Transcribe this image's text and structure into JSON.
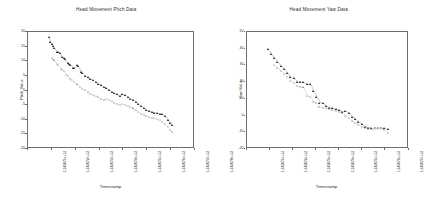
{
  "figure": {
    "background": "#ffffff",
    "marker_filled_color": "#111111",
    "marker_open_color": "#8a8a8a"
  },
  "panels": [
    {
      "id": "pitch-panel",
      "title": "Head Movement Pitch Data",
      "xlabel": "Timestamp",
      "ylabel": "Pitch Value",
      "yticks": [
        "20",
        "15",
        "10",
        "5",
        "0",
        "-5",
        "-10",
        "-15",
        "-20"
      ],
      "xticks": [
        "1.342071e+12",
        "1.342072e+12",
        "1.342073e+12",
        "1.342074e+12",
        "1.342075e+12",
        "1.342076e+12",
        "1.342077e+12",
        "1.342078e+12"
      ]
    },
    {
      "id": "yaw-panel",
      "title": "Head Movement Yaw Data",
      "xlabel": "Timestamp",
      "ylabel": "Yaw Value",
      "yticks": [
        "50",
        "40",
        "30",
        "20",
        "10",
        "0",
        "-10",
        "-20"
      ],
      "xticks": [
        "1.342071e+12",
        "1.342072e+12",
        "1.342073e+12",
        "1.342074e+12",
        "1.342075e+12",
        "1.342076e+12",
        "1.342077e+12",
        "1.342078e+12"
      ]
    }
  ],
  "chart_data": [
    {
      "type": "scatter",
      "title": "Head Movement Pitch Data",
      "xlabel": "Timestamp",
      "ylabel": "Pitch Value",
      "grid": false,
      "legend": "none",
      "xlim": [
        0,
        100
      ],
      "ylim": [
        -20,
        20
      ],
      "xtick_values": [
        0,
        14.3,
        28.6,
        42.9,
        57.1,
        71.4,
        85.7,
        100
      ],
      "ytick_values": [
        20,
        15,
        10,
        5,
        0,
        -5,
        -10,
        -15,
        -20
      ],
      "series": [
        {
          "name": "pitch-filled",
          "marker": "filled-triangle",
          "x": [
            13.5,
            14.2,
            15.0,
            15.8,
            16.6,
            18.2,
            19.0,
            19.8,
            21.4,
            22.2,
            23.0,
            24.6,
            25.4,
            26.2,
            27.8,
            28.6,
            30.2,
            31.0,
            32.6,
            33.4,
            35.0,
            36.6,
            38.2,
            39.8,
            41.4,
            43.0,
            44.6,
            46.2,
            47.8,
            49.4,
            51.0,
            52.6,
            54.2,
            55.8,
            57.4,
            59.0,
            60.6,
            62.2,
            63.8,
            65.4,
            67.0,
            68.6,
            70.2,
            71.8,
            73.4,
            75.0,
            76.6,
            78.2,
            79.8,
            81.4,
            83.0,
            84.6,
            86.2,
            87.0
          ],
          "y": [
            17.8,
            16.0,
            15.4,
            14.6,
            14.2,
            12.8,
            12.6,
            12.4,
            11.0,
            10.6,
            10.2,
            9.0,
            8.6,
            8.4,
            7.4,
            7.2,
            8.2,
            7.8,
            6.0,
            5.6,
            4.6,
            4.0,
            3.6,
            3.0,
            2.4,
            1.8,
            1.4,
            0.8,
            0.4,
            -0.2,
            -1.0,
            -1.4,
            -1.8,
            -2.2,
            -1.6,
            -2.0,
            -2.6,
            -3.2,
            -3.6,
            -4.4,
            -5.0,
            -5.8,
            -6.4,
            -7.0,
            -7.4,
            -7.8,
            -8.0,
            -8.2,
            -8.4,
            -8.6,
            -9.2,
            -10.4,
            -11.6,
            -12.4
          ]
        },
        {
          "name": "pitch-open",
          "marker": "open-triangle",
          "x": [
            15.0,
            15.8,
            16.6,
            18.2,
            19.0,
            20.6,
            21.4,
            22.2,
            23.8,
            24.6,
            26.2,
            27.0,
            28.6,
            30.2,
            31.8,
            33.4,
            35.0,
            36.6,
            38.2,
            39.8,
            41.4,
            43.0,
            44.6,
            46.2,
            47.8,
            49.4,
            51.0,
            52.6,
            54.2,
            55.8,
            57.4,
            59.0,
            60.6,
            62.2,
            63.8,
            65.4,
            67.0,
            68.6,
            70.2,
            71.8,
            73.4,
            75.0,
            76.6,
            78.2,
            79.8,
            81.4,
            83.0,
            84.6,
            86.2,
            87.2
          ],
          "y": [
            10.6,
            10.2,
            9.8,
            8.6,
            8.2,
            7.0,
            6.6,
            6.2,
            5.0,
            4.6,
            3.6,
            3.2,
            2.4,
            1.6,
            0.8,
            0.2,
            -0.4,
            -1.0,
            -1.6,
            -2.0,
            -2.4,
            -2.8,
            -3.2,
            -3.6,
            -3.4,
            -3.8,
            -4.2,
            -4.6,
            -5.0,
            -5.4,
            -5.0,
            -5.4,
            -5.8,
            -6.2,
            -6.6,
            -7.2,
            -7.8,
            -8.4,
            -8.8,
            -9.2,
            -9.6,
            -9.8,
            -10.0,
            -10.2,
            -10.6,
            -11.2,
            -12.0,
            -13.0,
            -14.0,
            -14.6
          ]
        }
      ]
    },
    {
      "type": "scatter",
      "title": "Head Movement Yaw Data",
      "xlabel": "Timestamp",
      "ylabel": "Yaw Value",
      "grid": false,
      "legend": "none",
      "xlim": [
        0,
        100
      ],
      "ylim": [
        -20,
        50
      ],
      "xtick_values": [
        0,
        14.3,
        28.6,
        42.9,
        57.1,
        71.4,
        85.7,
        100
      ],
      "ytick_values": [
        50,
        40,
        30,
        20,
        10,
        0,
        -10,
        -20
      ],
      "series": [
        {
          "name": "yaw-filled",
          "marker": "filled-triangle",
          "x": [
            14.0,
            16.0,
            18.0,
            20.0,
            22.0,
            24.0,
            26.0,
            28.0,
            30.0,
            32.0,
            34.0,
            36.0,
            38.0,
            40.0,
            42.0,
            44.0,
            46.0,
            48.0,
            50.0,
            52.0,
            54.0,
            56.0,
            58.0,
            60.0,
            62.0,
            64.0,
            66.0,
            68.0,
            70.0,
            72.0,
            74.0,
            76.0,
            78.0,
            80.0,
            82.0,
            84.0,
            86.0,
            88.0
          ],
          "y": [
            39.0,
            36.0,
            33.5,
            31.0,
            29.0,
            27.0,
            24.5,
            22.0,
            21.5,
            19.5,
            19.5,
            19.0,
            18.0,
            18.0,
            14.0,
            10.5,
            7.0,
            6.5,
            5.0,
            4.0,
            3.5,
            3.0,
            2.5,
            1.5,
            2.0,
            0.5,
            -1.5,
            -3.0,
            -4.5,
            -6.0,
            -7.5,
            -8.0,
            -8.5,
            -8.5,
            -8.5,
            -8.5,
            -8.5,
            -9.0
          ]
        },
        {
          "name": "yaw-open",
          "marker": "open-triangle",
          "x": [
            18.0,
            20.0,
            22.0,
            24.0,
            26.0,
            28.0,
            30.0,
            32.0,
            34.0,
            36.0,
            38.0,
            40.0,
            42.0,
            44.0,
            46.0,
            48.0,
            50.0,
            52.0,
            54.0,
            56.0,
            58.0,
            60.0,
            62.0,
            64.0,
            66.0,
            68.0,
            70.0,
            72.0,
            74.0,
            76.0,
            78.0,
            80.0,
            82.0,
            84.0,
            86.0,
            88.0
          ],
          "y": [
            29.5,
            27.5,
            26.0,
            24.0,
            22.0,
            20.0,
            18.5,
            17.0,
            16.5,
            16.0,
            11.0,
            10.5,
            7.5,
            6.5,
            4.5,
            4.0,
            3.5,
            3.0,
            2.5,
            2.0,
            1.5,
            0.5,
            -1.0,
            -2.5,
            -4.0,
            -5.5,
            -6.5,
            -7.5,
            -8.5,
            -9.0,
            -9.0,
            -8.5,
            -8.0,
            -8.5,
            -9.5,
            -11.0
          ]
        }
      ]
    }
  ]
}
